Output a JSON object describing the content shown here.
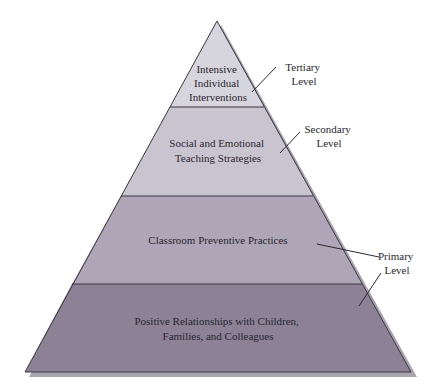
{
  "diagram": {
    "type": "pyramid",
    "levels": [
      {
        "name": "tier-top",
        "lines": [
          "Intensive",
          "Individual",
          "Interventions"
        ],
        "fill": "#d6d4dc"
      },
      {
        "name": "tier-2",
        "lines": [
          "Social and Emotional",
          "Teaching Strategies"
        ],
        "fill": "#c9c5d0"
      },
      {
        "name": "tier-3",
        "lines": [
          "Classroom Preventive Practices"
        ],
        "fill": "#aea6b6"
      },
      {
        "name": "tier-base",
        "lines": [
          "Positive Relationships with Children,",
          "Families, and Colleagues"
        ],
        "fill": "#8c8195"
      }
    ],
    "callouts": [
      {
        "name": "tertiary",
        "lines": [
          "Tertiary",
          "Level"
        ]
      },
      {
        "name": "secondary",
        "lines": [
          "Secondary",
          "Level"
        ]
      },
      {
        "name": "primary",
        "lines": [
          "Primary",
          "Level"
        ]
      }
    ],
    "colors": {
      "outline": "#3a3540",
      "shadow": "#9a96a0"
    }
  }
}
